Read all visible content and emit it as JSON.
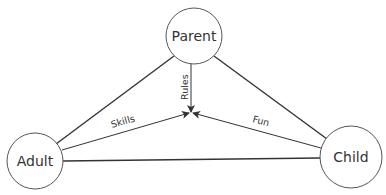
{
  "diagram": {
    "type": "triangle-relationship",
    "nodes": [
      {
        "id": "parent",
        "label": "Parent"
      },
      {
        "id": "adult",
        "label": "Adult"
      },
      {
        "id": "child",
        "label": "Child"
      }
    ],
    "edges": [
      {
        "from": "parent",
        "to": "adult"
      },
      {
        "from": "parent",
        "to": "child"
      },
      {
        "from": "adult",
        "to": "child"
      }
    ],
    "arrows": [
      {
        "from": "parent",
        "to": "center",
        "label": "Rules"
      },
      {
        "from": "adult",
        "to": "center",
        "label": "Skills"
      },
      {
        "from": "child",
        "to": "center",
        "label": "Fun"
      }
    ]
  }
}
